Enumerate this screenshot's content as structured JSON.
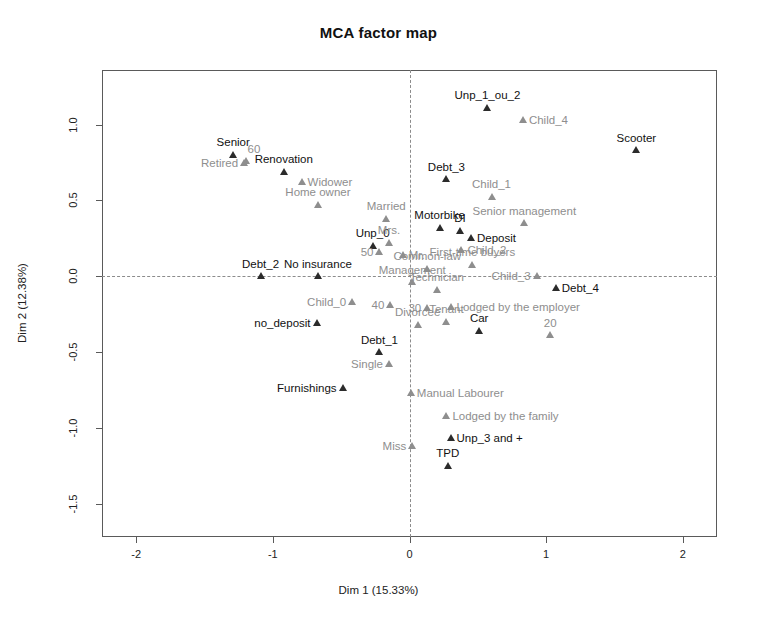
{
  "chart_data": {
    "type": "scatter",
    "title": "MCA factor map",
    "xlabel": "Dim 1 (15.33%)",
    "ylabel": "Dim 2 (12.38%)",
    "xlim": [
      -2.25,
      2.25
    ],
    "ylim": [
      -1.72,
      1.36
    ],
    "xticks": [
      "-2",
      "-1",
      "0",
      "1",
      "2"
    ],
    "xtick_values": [
      -2,
      -1,
      0,
      1,
      2
    ],
    "yticks": [
      "1.0",
      "0.5",
      "0.0",
      "-0.5",
      "-1.0",
      "-1.5"
    ],
    "ytick_values": [
      1.0,
      0.5,
      0.0,
      -0.5,
      -1.0,
      -1.5
    ],
    "grid": false,
    "legend": "none",
    "reference_lines": {
      "vertical_at_x": 0,
      "horizontal_at_y": 0,
      "style": "dashed"
    },
    "colors": {
      "active_point": "#2b2b2b",
      "supplementary_point": "#8e8e8e",
      "frame": "#5a5a5a"
    },
    "points": [
      {
        "label": "Unp_1_ou_2",
        "x": 0.57,
        "y": 1.11,
        "color": "black",
        "anchor": "above"
      },
      {
        "label": "Child_4",
        "x": 0.83,
        "y": 1.03,
        "color": "gray",
        "anchor": "right"
      },
      {
        "label": "Scooter",
        "x": 1.66,
        "y": 0.83,
        "color": "black",
        "anchor": "above"
      },
      {
        "label": "Senior",
        "x": -1.29,
        "y": 0.8,
        "color": "black",
        "anchor": "above"
      },
      {
        "label": "60",
        "x": -1.2,
        "y": 0.76,
        "color": "gray",
        "anchor": "aboveright"
      },
      {
        "label": "Retired",
        "x": -1.21,
        "y": 0.745,
        "color": "gray",
        "anchor": "left"
      },
      {
        "label": "Renovation",
        "x": -0.92,
        "y": 0.69,
        "color": "black",
        "anchor": "above"
      },
      {
        "label": "Widower",
        "x": -0.79,
        "y": 0.62,
        "color": "gray",
        "anchor": "right"
      },
      {
        "label": "Debt_3",
        "x": 0.27,
        "y": 0.64,
        "color": "black",
        "anchor": "above"
      },
      {
        "label": "Child_1",
        "x": 0.6,
        "y": 0.525,
        "color": "gray",
        "anchor": "above"
      },
      {
        "label": "Home owner",
        "x": -0.67,
        "y": 0.47,
        "color": "gray",
        "anchor": "above"
      },
      {
        "label": "Married",
        "x": -0.17,
        "y": 0.38,
        "color": "gray",
        "anchor": "above"
      },
      {
        "label": "Motorbike",
        "x": 0.22,
        "y": 0.32,
        "color": "black",
        "anchor": "above"
      },
      {
        "label": "DI",
        "x": 0.37,
        "y": 0.3,
        "color": "black",
        "anchor": "above"
      },
      {
        "label": "Senior management",
        "x": 0.84,
        "y": 0.35,
        "color": "gray",
        "anchor": "above"
      },
      {
        "label": "Deposit",
        "x": 0.45,
        "y": 0.255,
        "color": "black",
        "anchor": "right"
      },
      {
        "label": "Unp_0",
        "x": -0.27,
        "y": 0.2,
        "color": "black",
        "anchor": "above"
      },
      {
        "label": "Mrs.",
        "x": -0.15,
        "y": 0.22,
        "color": "gray",
        "anchor": "above"
      },
      {
        "label": "50",
        "x": -0.22,
        "y": 0.16,
        "color": "gray",
        "anchor": "left"
      },
      {
        "label": "Mr.",
        "x": -0.05,
        "y": 0.14,
        "color": "gray",
        "anchor": "right"
      },
      {
        "label": "Child_2",
        "x": 0.38,
        "y": 0.17,
        "color": "gray",
        "anchor": "right"
      },
      {
        "label": "First-time buyers",
        "x": 0.46,
        "y": 0.075,
        "color": "gray",
        "anchor": "above"
      },
      {
        "label": "Common-law",
        "x": 0.13,
        "y": 0.05,
        "color": "gray",
        "anchor": "above"
      },
      {
        "label": "Debt_2",
        "x": -1.09,
        "y": 0.0,
        "color": "black",
        "anchor": "above"
      },
      {
        "label": "No insurance",
        "x": -0.67,
        "y": 0.0,
        "color": "black",
        "anchor": "above"
      },
      {
        "label": "Management",
        "x": 0.02,
        "y": -0.04,
        "color": "gray",
        "anchor": "above"
      },
      {
        "label": "Child_3",
        "x": 0.93,
        "y": 0.0,
        "color": "gray",
        "anchor": "left"
      },
      {
        "label": "Technician",
        "x": 0.2,
        "y": -0.09,
        "color": "gray",
        "anchor": "above"
      },
      {
        "label": "Debt_4",
        "x": 1.07,
        "y": -0.08,
        "color": "black",
        "anchor": "right"
      },
      {
        "label": "Child_0",
        "x": -0.42,
        "y": -0.17,
        "color": "gray",
        "anchor": "left"
      },
      {
        "label": "40",
        "x": -0.14,
        "y": -0.19,
        "color": "gray",
        "anchor": "left"
      },
      {
        "label": "30",
        "x": 0.13,
        "y": -0.21,
        "color": "gray",
        "anchor": "left"
      },
      {
        "label": "Lodged by the employer",
        "x": 0.3,
        "y": -0.2,
        "color": "gray",
        "anchor": "right"
      },
      {
        "label": "no_deposit",
        "x": -0.68,
        "y": -0.31,
        "color": "black",
        "anchor": "left"
      },
      {
        "label": "Divorcee",
        "x": 0.06,
        "y": -0.32,
        "color": "gray",
        "anchor": "above"
      },
      {
        "label": "Tenant",
        "x": 0.27,
        "y": -0.3,
        "color": "gray",
        "anchor": "above"
      },
      {
        "label": "Car",
        "x": 0.51,
        "y": -0.36,
        "color": "black",
        "anchor": "above"
      },
      {
        "label": "20",
        "x": 1.03,
        "y": -0.39,
        "color": "gray",
        "anchor": "above"
      },
      {
        "label": "Debt_1",
        "x": -0.22,
        "y": -0.5,
        "color": "black",
        "anchor": "above"
      },
      {
        "label": "Single",
        "x": -0.15,
        "y": -0.58,
        "color": "gray",
        "anchor": "left"
      },
      {
        "label": "Furnishings",
        "x": -0.49,
        "y": -0.74,
        "color": "black",
        "anchor": "left"
      },
      {
        "label": "Manual Labourer",
        "x": 0.01,
        "y": -0.77,
        "color": "gray",
        "anchor": "right"
      },
      {
        "label": "Lodged by the family",
        "x": 0.27,
        "y": -0.92,
        "color": "gray",
        "anchor": "right"
      },
      {
        "label": "Unp_3 and +",
        "x": 0.3,
        "y": -1.07,
        "color": "black",
        "anchor": "right"
      },
      {
        "label": "Miss",
        "x": 0.02,
        "y": -1.12,
        "color": "gray",
        "anchor": "left"
      },
      {
        "label": "TPD",
        "x": 0.28,
        "y": -1.25,
        "color": "black",
        "anchor": "above"
      }
    ]
  }
}
